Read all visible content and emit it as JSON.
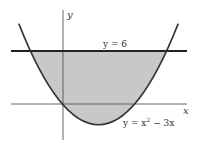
{
  "figure": {
    "y_axis_label": "y",
    "x_axis_label": "x",
    "line_label": "y = 6",
    "curve_label_prefix": "y = x",
    "curve_label_exp": "2",
    "curve_label_suffix": " − 3x",
    "colors": {
      "shade": "#c8c8c8",
      "curve": "#333333",
      "axes": "#555555",
      "background": "#ffffff"
    },
    "region": "area between y = 6 and y = x^2 - 3x"
  }
}
